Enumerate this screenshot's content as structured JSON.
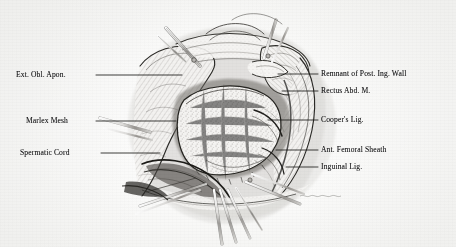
{
  "figure": {
    "kind": "surgical-illustration",
    "style": "pen-and-ink stipple drawing, grayscale scan",
    "ink_color": "#1a1a1c",
    "paper_color": "#fbfbfa",
    "width": 456,
    "height": 247
  },
  "labels": {
    "left": [
      {
        "id": "ext-obl-apon",
        "text": "Ext. Obl. Apon.",
        "x": 16,
        "y": 70,
        "leader_from_x": 96,
        "leader_to_x": 182,
        "leader_y": 75
      },
      {
        "id": "marlex-mesh",
        "text": "Marlex Mesh",
        "x": 26,
        "y": 116,
        "leader_from_x": 96,
        "leader_to_x": 176,
        "leader_y": 121
      },
      {
        "id": "spermatic-cord",
        "text": "Spermatic Cord",
        "x": 20,
        "y": 148,
        "leader_from_x": 101,
        "leader_to_x": 160,
        "leader_y": 153
      }
    ],
    "right": [
      {
        "id": "remnant-post-ing-wall",
        "text": "Remnant of Post. Ing. Wall",
        "x": 321,
        "y": 69,
        "leader_from_x": 278,
        "leader_to_x": 318,
        "leader_y": 74
      },
      {
        "id": "rectus-abd-m",
        "text": "Rectus Abd. M.",
        "x": 321,
        "y": 86,
        "leader_from_x": 282,
        "leader_to_x": 318,
        "leader_y": 91
      },
      {
        "id": "coopers-lig",
        "text": "Cooper's Lig.",
        "x": 321,
        "y": 115,
        "leader_from_x": 268,
        "leader_to_x": 318,
        "leader_y": 120
      },
      {
        "id": "ant-femoral-sheath",
        "text": "Ant. Femoral Sheath",
        "x": 321,
        "y": 145,
        "leader_from_x": 276,
        "leader_to_x": 318,
        "leader_y": 150
      },
      {
        "id": "inguinal-lig",
        "text": "Inguinal Lig.",
        "x": 321,
        "y": 162,
        "leader_from_x": 286,
        "leader_to_x": 318,
        "leader_y": 167
      }
    ]
  }
}
